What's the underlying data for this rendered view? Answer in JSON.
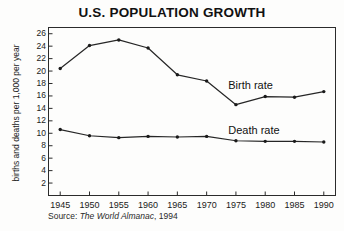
{
  "chart_data": {
    "type": "line",
    "title": "U.S. POPULATION GROWTH",
    "xlabel": "",
    "ylabel": "births and deaths per 1,000 per year",
    "x": [
      1945,
      1950,
      1955,
      1960,
      1965,
      1970,
      1975,
      1980,
      1985,
      1990
    ],
    "xtick_labels": [
      "1945",
      "1950",
      "1955",
      "1960",
      "1965",
      "1970",
      "1975",
      "1980",
      "1985",
      "1990"
    ],
    "ytick_labels": [
      "26",
      "24",
      "22",
      "20",
      "18",
      "16",
      "14",
      "12",
      "10",
      "8",
      "6",
      "4",
      "2"
    ],
    "yticks": [
      26,
      24,
      22,
      20,
      18,
      16,
      14,
      12,
      10,
      8,
      6,
      4,
      2
    ],
    "xlim": [
      1943,
      1992
    ],
    "ylim": [
      0,
      27
    ],
    "grid": false,
    "legend_position": "inline-right",
    "series": [
      {
        "name": "Birth rate",
        "values": [
          20.4,
          24.1,
          25.0,
          23.7,
          19.4,
          18.4,
          14.6,
          15.9,
          15.8,
          16.7
        ]
      },
      {
        "name": "Death rate",
        "values": [
          10.6,
          9.6,
          9.3,
          9.5,
          9.4,
          9.5,
          8.8,
          8.7,
          8.7,
          8.6
        ]
      }
    ],
    "annotations": [
      {
        "text": "Birth rate",
        "x": 1979.5,
        "y": 17.6
      },
      {
        "text": "Death rate",
        "x": 1979.5,
        "y": 10.4
      }
    ],
    "source_prefix": "Source: ",
    "source_italic": "The World Almanac",
    "source_suffix": ", 1994"
  },
  "colors": {
    "line": "#262626",
    "axis": "#2b2b2b",
    "text": "#1a1a1a",
    "background": "#fdfdfc"
  }
}
